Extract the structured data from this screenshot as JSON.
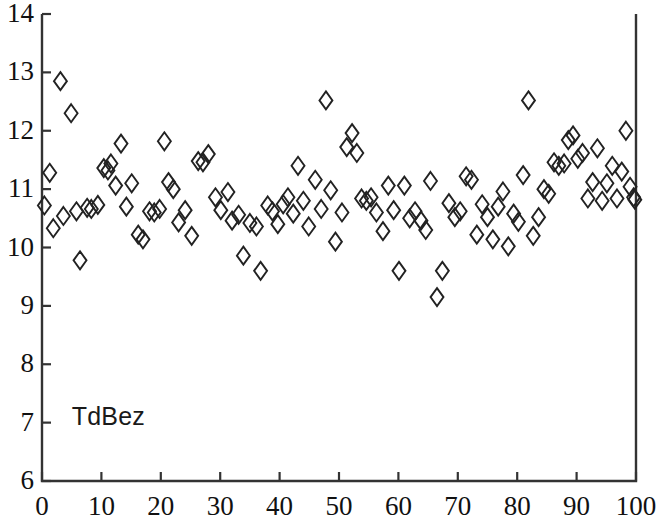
{
  "chart_data": {
    "type": "scatter",
    "title": "",
    "series_label": "TdBez",
    "xlabel": "",
    "ylabel": "",
    "xlim": [
      0,
      100
    ],
    "ylim": [
      6,
      14
    ],
    "xticks": [
      0,
      10,
      20,
      30,
      40,
      50,
      60,
      70,
      80,
      90,
      100
    ],
    "yticks": [
      6,
      7,
      8,
      9,
      10,
      11,
      12,
      13,
      14
    ],
    "xtick_labels": [
      "0",
      "10",
      "20",
      "30",
      "40",
      "50",
      "60",
      "70",
      "80",
      "90",
      "100"
    ],
    "ytick_labels": [
      "6",
      "7",
      "8",
      "9",
      "10",
      "11",
      "12",
      "13",
      "14"
    ],
    "grid": false,
    "legend": "none",
    "marker": "open-diamond",
    "marker_color": "#222222",
    "marker_size": 9,
    "points": [
      [
        0.4,
        10.72
      ],
      [
        1.3,
        11.28
      ],
      [
        1.9,
        10.33
      ],
      [
        3.1,
        12.85
      ],
      [
        3.6,
        10.54
      ],
      [
        4.9,
        12.3
      ],
      [
        5.8,
        10.62
      ],
      [
        6.4,
        9.78
      ],
      [
        7.6,
        10.68
      ],
      [
        8.3,
        10.66
      ],
      [
        9.4,
        10.73
      ],
      [
        10.4,
        11.36
      ],
      [
        11.1,
        11.32
      ],
      [
        11.6,
        11.44
      ],
      [
        12.4,
        11.06
      ],
      [
        13.3,
        11.78
      ],
      [
        14.2,
        10.7
      ],
      [
        15.1,
        11.1
      ],
      [
        16.2,
        10.22
      ],
      [
        17.0,
        10.14
      ],
      [
        18.1,
        10.62
      ],
      [
        18.9,
        10.6
      ],
      [
        19.8,
        10.66
      ],
      [
        20.6,
        11.82
      ],
      [
        21.3,
        11.12
      ],
      [
        22.1,
        11.0
      ],
      [
        23.0,
        10.43
      ],
      [
        24.1,
        10.64
      ],
      [
        25.2,
        10.2
      ],
      [
        26.3,
        11.48
      ],
      [
        27.1,
        11.46
      ],
      [
        28.0,
        11.6
      ],
      [
        29.2,
        10.86
      ],
      [
        30.1,
        10.64
      ],
      [
        31.3,
        10.95
      ],
      [
        32.0,
        10.46
      ],
      [
        33.1,
        10.56
      ],
      [
        33.9,
        9.86
      ],
      [
        35.0,
        10.42
      ],
      [
        36.1,
        10.36
      ],
      [
        36.8,
        9.6
      ],
      [
        38.0,
        10.72
      ],
      [
        38.8,
        10.62
      ],
      [
        39.7,
        10.4
      ],
      [
        40.6,
        10.74
      ],
      [
        41.4,
        10.86
      ],
      [
        42.3,
        10.58
      ],
      [
        43.1,
        11.4
      ],
      [
        44.0,
        10.8
      ],
      [
        44.9,
        10.36
      ],
      [
        46.0,
        11.16
      ],
      [
        47.0,
        10.66
      ],
      [
        47.8,
        12.52
      ],
      [
        48.6,
        10.98
      ],
      [
        49.4,
        10.1
      ],
      [
        50.5,
        10.6
      ],
      [
        51.3,
        11.72
      ],
      [
        52.2,
        11.96
      ],
      [
        53.0,
        11.62
      ],
      [
        53.8,
        10.84
      ],
      [
        54.6,
        10.8
      ],
      [
        55.4,
        10.86
      ],
      [
        56.3,
        10.6
      ],
      [
        57.4,
        10.28
      ],
      [
        58.3,
        11.06
      ],
      [
        59.2,
        10.64
      ],
      [
        60.1,
        9.6
      ],
      [
        61.0,
        11.06
      ],
      [
        61.9,
        10.5
      ],
      [
        62.8,
        10.62
      ],
      [
        63.8,
        10.46
      ],
      [
        64.6,
        10.3
      ],
      [
        65.4,
        11.14
      ],
      [
        66.5,
        9.15
      ],
      [
        67.4,
        9.6
      ],
      [
        68.5,
        10.76
      ],
      [
        69.5,
        10.52
      ],
      [
        70.4,
        10.62
      ],
      [
        71.4,
        11.22
      ],
      [
        72.3,
        11.16
      ],
      [
        73.2,
        10.22
      ],
      [
        74.1,
        10.74
      ],
      [
        75.0,
        10.52
      ],
      [
        75.9,
        10.14
      ],
      [
        76.8,
        10.7
      ],
      [
        77.6,
        10.96
      ],
      [
        78.5,
        10.02
      ],
      [
        79.4,
        10.58
      ],
      [
        80.2,
        10.44
      ],
      [
        81.0,
        11.24
      ],
      [
        81.9,
        12.52
      ],
      [
        82.7,
        10.2
      ],
      [
        83.6,
        10.52
      ],
      [
        84.5,
        11.0
      ],
      [
        85.3,
        10.92
      ],
      [
        86.2,
        11.46
      ],
      [
        87.0,
        11.4
      ],
      [
        87.9,
        11.44
      ],
      [
        88.6,
        11.84
      ],
      [
        89.4,
        11.92
      ],
      [
        90.2,
        11.52
      ],
      [
        91.0,
        11.62
      ],
      [
        91.9,
        10.84
      ],
      [
        92.7,
        11.12
      ],
      [
        93.5,
        11.7
      ],
      [
        94.3,
        10.8
      ],
      [
        95.1,
        11.1
      ],
      [
        96.0,
        11.4
      ],
      [
        96.8,
        10.84
      ],
      [
        97.6,
        11.3
      ],
      [
        98.3,
        12.0
      ],
      [
        99.0,
        11.04
      ],
      [
        99.6,
        10.86
      ],
      [
        99.8,
        10.82
      ]
    ]
  },
  "axes": {
    "frame_color": "#333333",
    "background": "#ffffff"
  }
}
